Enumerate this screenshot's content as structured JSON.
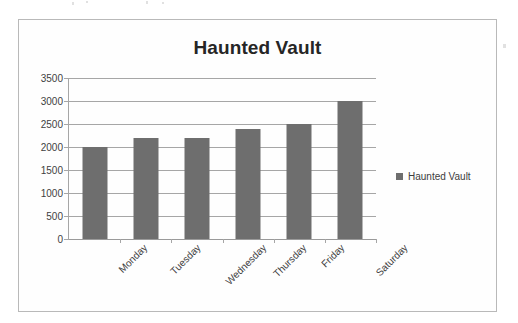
{
  "card": {
    "border_color": "#b9b9b9",
    "background": "#fefefe"
  },
  "legend": {
    "entries": [
      {
        "label": "Haunted Vault",
        "color": "#6e6e6e",
        "marker": "square-marker-icon"
      }
    ],
    "position": "right"
  },
  "chart_data": {
    "type": "bar",
    "title": "Haunted Vault",
    "xlabel": "",
    "ylabel": "",
    "categories": [
      "Monday",
      "Tuesday",
      "Wednesday",
      "Thursday",
      "Friday",
      "Saturday"
    ],
    "values": [
      2000,
      2200,
      2200,
      2400,
      2500,
      3000
    ],
    "series": [
      {
        "name": "Haunted Vault",
        "color": "#6e6e6e",
        "values": [
          2000,
          2200,
          2200,
          2400,
          2500,
          3000
        ]
      }
    ],
    "ylim": [
      0,
      3500
    ],
    "ytick_step": 500,
    "yticks": [
      0,
      500,
      1000,
      1500,
      2000,
      2500,
      3000,
      3500
    ],
    "ytick_labels": [
      "0",
      "500",
      "1000",
      "1500",
      "2000",
      "2500",
      "3000",
      "3500"
    ],
    "grid": true,
    "grid_axis": "y",
    "xtick_label_rotation": -45,
    "legend_position": "right"
  }
}
